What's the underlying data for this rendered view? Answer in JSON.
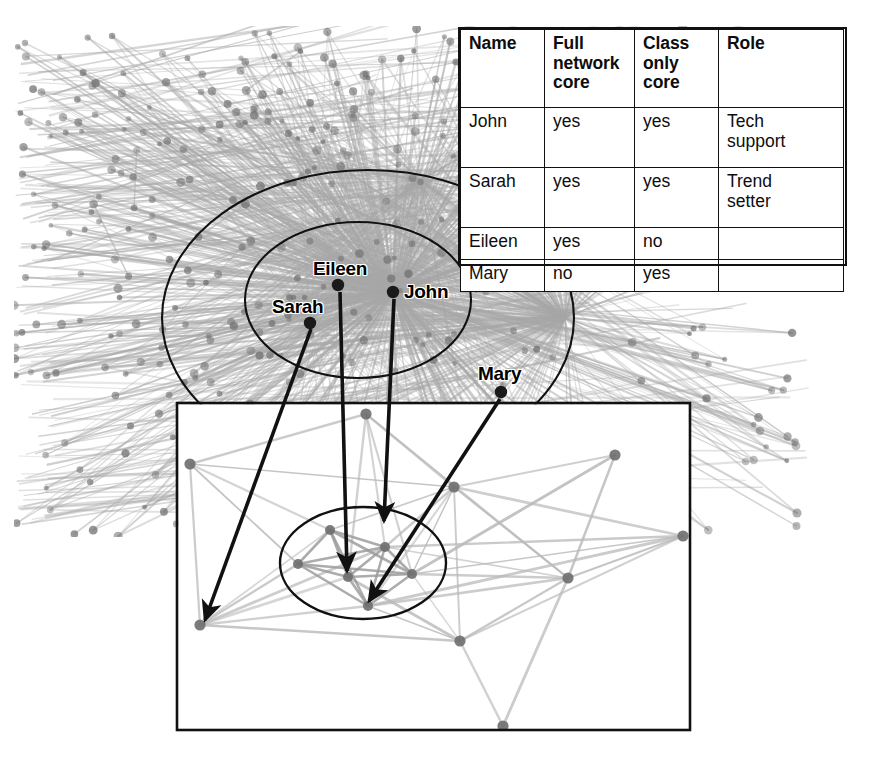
{
  "legend": {
    "headers": [
      "Name",
      "Full network core",
      "Class only core",
      "Role"
    ],
    "header_lines": [
      [
        "Name"
      ],
      [
        "Full",
        "network",
        "core"
      ],
      [
        "Class",
        "only",
        "core"
      ],
      [
        "Role"
      ]
    ],
    "rows": [
      {
        "name": "John",
        "full_network_core": "yes",
        "class_only_core": "yes",
        "role": "Tech support",
        "role_lines": [
          "Tech",
          "support"
        ]
      },
      {
        "name": "Sarah",
        "full_network_core": "yes",
        "class_only_core": "yes",
        "role": "Trend setter",
        "role_lines": [
          "Trend",
          "setter"
        ]
      },
      {
        "name": "Eileen",
        "full_network_core": "yes",
        "class_only_core": "no",
        "role": "",
        "role_lines": [
          ""
        ]
      },
      {
        "name": "Mary",
        "full_network_core": "no",
        "class_only_core": "yes",
        "role": "",
        "role_lines": [
          ""
        ]
      }
    ]
  },
  "labels": [
    {
      "id": "eileen",
      "text": "Eileen",
      "x": 313,
      "y": 258
    },
    {
      "id": "john",
      "text": "John",
      "x": 404,
      "y": 281
    },
    {
      "id": "sarah",
      "text": "Sarah",
      "x": 272,
      "y": 296
    },
    {
      "id": "mary",
      "text": "Mary",
      "x": 478,
      "y": 363
    }
  ],
  "colors": {
    "ink": "#111111",
    "node_dark": "#1a1a1a",
    "node_grey": "#6e6e6e",
    "edge_light": "#b9b9b9",
    "edge_mid": "#9a9a9a",
    "hairball": "#a8a8a8",
    "background": "#ffffff"
  },
  "graph": {
    "full_network": {
      "hub": {
        "x": 393,
        "y": 292,
        "name": "John"
      },
      "secondary_hub": {
        "x": 565,
        "y": 318
      },
      "bounds": {
        "x": 14,
        "y": 26,
        "w": 796,
        "h": 511
      },
      "outer_ellipse": {
        "cx": 368,
        "cy": 318,
        "rx": 206,
        "ry": 148
      },
      "inner_ellipse": {
        "cx": 358,
        "cy": 300,
        "rx": 113,
        "ry": 78
      },
      "core_nodes": [
        {
          "name": "Eileen",
          "x": 338,
          "y": 285
        },
        {
          "name": "John",
          "x": 393,
          "y": 292
        },
        {
          "name": "Sarah",
          "x": 310,
          "y": 323
        },
        {
          "name": "Mary",
          "x": 501,
          "y": 392
        }
      ]
    },
    "class_box": {
      "x": 177,
      "y": 403,
      "w": 513,
      "h": 327,
      "inner_ellipse": {
        "cx": 363,
        "cy": 563,
        "rx": 83,
        "ry": 56
      },
      "nodes": [
        {
          "id": "n1",
          "x": 190,
          "y": 464,
          "core": false
        },
        {
          "id": "n2",
          "x": 366,
          "y": 414,
          "core": false
        },
        {
          "id": "n3",
          "x": 615,
          "y": 455,
          "core": false
        },
        {
          "id": "n4",
          "x": 454,
          "y": 487,
          "core": false
        },
        {
          "id": "n5",
          "x": 683,
          "y": 536,
          "core": false
        },
        {
          "id": "n6",
          "x": 568,
          "y": 578,
          "core": false
        },
        {
          "id": "n7",
          "x": 200,
          "y": 625,
          "core": false
        },
        {
          "id": "n8",
          "x": 460,
          "y": 641,
          "core": false
        },
        {
          "id": "n9",
          "x": 503,
          "y": 726,
          "core": false
        },
        {
          "id": "c1",
          "x": 330,
          "y": 530,
          "core": true
        },
        {
          "id": "c2",
          "x": 385,
          "y": 547,
          "core": true
        },
        {
          "id": "c3",
          "x": 298,
          "y": 564,
          "core": true
        },
        {
          "id": "c4",
          "x": 348,
          "y": 577,
          "core": true
        },
        {
          "id": "c5",
          "x": 412,
          "y": 574,
          "core": true
        },
        {
          "id": "c6",
          "x": 368,
          "y": 606,
          "core": true
        }
      ],
      "edges": [
        [
          "n1",
          "n2"
        ],
        [
          "n1",
          "n7"
        ],
        [
          "n1",
          "c3"
        ],
        [
          "n1",
          "c1"
        ],
        [
          "n1",
          "n4"
        ],
        [
          "n2",
          "n4"
        ],
        [
          "n2",
          "c2"
        ],
        [
          "n2",
          "c4"
        ],
        [
          "n2",
          "n6"
        ],
        [
          "n2",
          "c5"
        ],
        [
          "n3",
          "n4"
        ],
        [
          "n3",
          "n6"
        ],
        [
          "n3",
          "c5"
        ],
        [
          "n4",
          "n5"
        ],
        [
          "n4",
          "n6"
        ],
        [
          "n4",
          "c2"
        ],
        [
          "n4",
          "c5"
        ],
        [
          "n4",
          "c6"
        ],
        [
          "n4",
          "n8"
        ],
        [
          "n4",
          "c1"
        ],
        [
          "n5",
          "c5"
        ],
        [
          "n5",
          "c2"
        ],
        [
          "n5",
          "n6"
        ],
        [
          "n5",
          "c6"
        ],
        [
          "n5",
          "n8"
        ],
        [
          "n6",
          "n8"
        ],
        [
          "n6",
          "c6"
        ],
        [
          "n6",
          "c5"
        ],
        [
          "n6",
          "n9"
        ],
        [
          "n6",
          "c2"
        ],
        [
          "n7",
          "c3"
        ],
        [
          "n7",
          "c4"
        ],
        [
          "n7",
          "c6"
        ],
        [
          "n7",
          "c1"
        ],
        [
          "n7",
          "n8"
        ],
        [
          "n7",
          "c2"
        ],
        [
          "n8",
          "c6"
        ],
        [
          "n8",
          "c4"
        ],
        [
          "n8",
          "n9"
        ],
        [
          "n8",
          "c5"
        ],
        [
          "c1",
          "c2"
        ],
        [
          "c1",
          "c3"
        ],
        [
          "c1",
          "c4"
        ],
        [
          "c1",
          "c5"
        ],
        [
          "c1",
          "c6"
        ],
        [
          "c2",
          "c3"
        ],
        [
          "c2",
          "c4"
        ],
        [
          "c2",
          "c5"
        ],
        [
          "c2",
          "c6"
        ],
        [
          "c3",
          "c4"
        ],
        [
          "c3",
          "c5"
        ],
        [
          "c3",
          "c6"
        ],
        [
          "c4",
          "c5"
        ],
        [
          "c4",
          "c6"
        ],
        [
          "c5",
          "c6"
        ]
      ]
    },
    "arrows": [
      {
        "from": "Sarah",
        "x1": 311,
        "y1": 329,
        "x2": 205,
        "y2": 620
      },
      {
        "from": "Eileen",
        "x1": 340,
        "y1": 292,
        "x2": 347,
        "y2": 571
      },
      {
        "from": "John",
        "x1": 394,
        "y1": 299,
        "x2": 384,
        "y2": 521
      },
      {
        "from": "Mary",
        "x1": 500,
        "y1": 399,
        "x2": 369,
        "y2": 601
      }
    ]
  }
}
